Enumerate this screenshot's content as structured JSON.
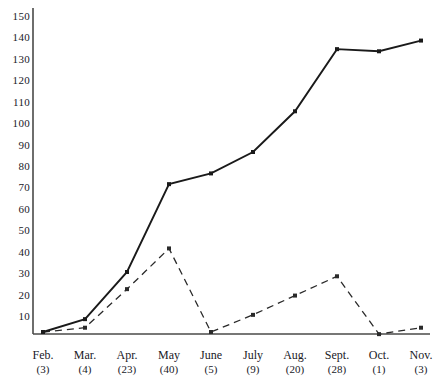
{
  "chart_data": {
    "type": "line",
    "title": "",
    "subtitle": "",
    "xlabel": "",
    "ylabel": "",
    "ylim": [
      0,
      155
    ],
    "grid": false,
    "legend_position": "none",
    "categories": [
      "Feb.",
      "Mar.",
      "Apr.",
      "May",
      "June",
      "July",
      "Aug.",
      "Sept.",
      "Oct.",
      "Nov."
    ],
    "category_counts": [
      "(3)",
      "(4)",
      "(23)",
      "(40)",
      "(5)",
      "(9)",
      "(20)",
      "(28)",
      "(1)",
      "(3)"
    ],
    "ytick_labels": [
      "10",
      "20",
      "30",
      "40",
      "50",
      "60",
      "70",
      "80",
      "90",
      "100",
      "110",
      "120",
      "130",
      "140",
      "150"
    ],
    "ytick_values": [
      10,
      20,
      30,
      40,
      50,
      60,
      70,
      80,
      90,
      100,
      110,
      120,
      130,
      140,
      150
    ],
    "series": [
      {
        "name": "cumulative-solid",
        "style": "solid",
        "color": "#1a1a1a",
        "values": [
          3,
          9,
          31,
          72,
          77,
          87,
          106,
          135,
          134,
          139
        ]
      },
      {
        "name": "monthly-dashed",
        "style": "dashed",
        "color": "#2a2a2a",
        "values": [
          3,
          5,
          23,
          42,
          3,
          11,
          20,
          29,
          2,
          5
        ]
      }
    ]
  },
  "axes": {
    "y_axis_label": "y-axis",
    "x_axis_label": "x-axis"
  }
}
